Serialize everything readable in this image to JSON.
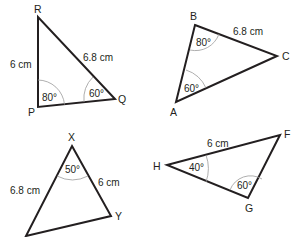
{
  "diagram": {
    "triangles": [
      {
        "id": "PQR",
        "vertices": {
          "R": "R",
          "P": "P",
          "Q": "Q"
        },
        "sides": {
          "PR": "6 cm",
          "RQ": "6.8 cm"
        },
        "angles": {
          "P": "80°",
          "Q": "60°"
        }
      },
      {
        "id": "ABC",
        "vertices": {
          "B": "B",
          "C": "C",
          "A": "A"
        },
        "sides": {
          "BC": "6.8 cm"
        },
        "angles": {
          "B": "80°",
          "A": "60°"
        }
      },
      {
        "id": "XYZ",
        "vertices": {
          "X": "X",
          "Y": "Y"
        },
        "sides": {
          "X_left": "6.8 cm",
          "XY": "6 cm"
        },
        "angles": {
          "X": "50°"
        }
      },
      {
        "id": "FGH",
        "vertices": {
          "H": "H",
          "F": "F",
          "G": "G"
        },
        "sides": {
          "HF": "6 cm"
        },
        "angles": {
          "H": "40°",
          "G": "60°"
        }
      }
    ]
  }
}
